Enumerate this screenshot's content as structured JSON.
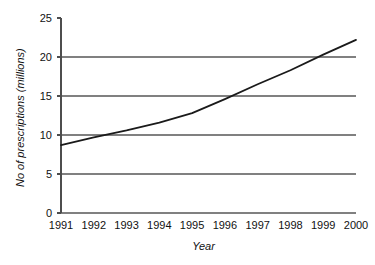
{
  "chart_data": {
    "type": "line",
    "title": "",
    "xlabel": "Year",
    "ylabel": "No of prescriptions (millions)",
    "x": [
      1991,
      1992,
      1993,
      1994,
      1995,
      1996,
      1997,
      1998,
      1999,
      2000
    ],
    "categories": [
      "1991",
      "1992",
      "1993",
      "1994",
      "1995",
      "1996",
      "1997",
      "1998",
      "1999",
      "2000"
    ],
    "values": [
      8.7,
      9.7,
      10.6,
      11.6,
      12.8,
      14.6,
      16.5,
      18.3,
      20.3,
      22.2
    ],
    "series": [
      {
        "name": "No of prescriptions (millions)",
        "values": [
          8.7,
          9.7,
          10.6,
          11.6,
          12.8,
          14.6,
          16.5,
          18.3,
          20.3,
          22.2
        ],
        "color": "#1a1a1a"
      }
    ],
    "ylim": [
      0,
      25
    ],
    "xlim": [
      1991,
      2000
    ],
    "yticks": [
      0,
      5,
      10,
      15,
      20,
      25
    ],
    "ytick_labels": [
      "0",
      "5",
      "10",
      "15",
      "20",
      "25"
    ],
    "xtick_labels": [
      "1991",
      "1992",
      "1993",
      "1994",
      "1995",
      "1996",
      "1997",
      "1998",
      "1999",
      "2000"
    ],
    "grid": true,
    "grid_axis": "y",
    "grid_color": "#808080",
    "axis_color": "#4d4d4d",
    "legend": false,
    "legend_position": "none",
    "annotations": []
  }
}
